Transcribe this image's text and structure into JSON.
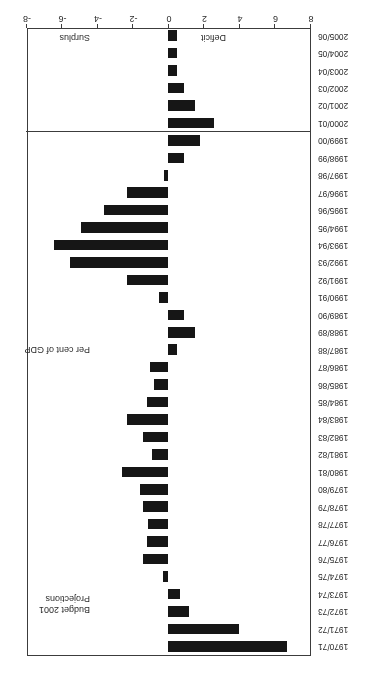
{
  "chart_data": {
    "type": "bar",
    "orientation": "horizontal",
    "title": "",
    "xlabel": "Per cent of GDP",
    "ylabel": "",
    "xlim": [
      -8,
      8
    ],
    "grid": false,
    "legend": null,
    "note": "Negative values are deficits (plotted to the right); positive values are surpluses (plotted to the left).",
    "categories": [
      "1970/71",
      "1971/72",
      "1972/73",
      "1973/74",
      "1974/75",
      "1975/76",
      "1976/77",
      "1977/78",
      "1978/79",
      "1979/80",
      "1980/81",
      "1981/82",
      "1982/83",
      "1983/84",
      "1984/85",
      "1985/86",
      "1986/87",
      "1987/88",
      "1988/89",
      "1989/90",
      "1990/91",
      "1991/92",
      "1992/93",
      "1993/94",
      "1994/95",
      "1995/96",
      "1996/97",
      "1997/98",
      "1998/99",
      "1999/00",
      "2000/01",
      "2001/02",
      "2002/03",
      "2003/04",
      "2004/05",
      "2005/06"
    ],
    "values": [
      6.7,
      4.0,
      1.2,
      0.7,
      -0.3,
      -1.4,
      -1.2,
      -1.1,
      -1.4,
      -1.6,
      -2.6,
      -0.9,
      -1.4,
      -2.3,
      -1.2,
      -0.8,
      -1.0,
      0.5,
      1.5,
      0.9,
      -0.5,
      -2.3,
      -5.5,
      -6.4,
      -4.9,
      -3.6,
      -2.3,
      -0.2,
      0.9,
      1.8,
      2.6,
      1.5,
      0.9,
      0.5,
      0.5,
      0.5
    ],
    "value_labels": null,
    "xticks": [
      8,
      6,
      4,
      2,
      0,
      -2,
      -4,
      -6,
      -8
    ],
    "xticklabels": [
      "8",
      "6",
      "4",
      "2",
      "0",
      "-2",
      "-4",
      "-6",
      "-8"
    ],
    "projection_start_category": "2000/01",
    "bar_color": "#161616",
    "frame_color": "#3c3c3c"
  },
  "annotations": {
    "surplus": "Surplus",
    "deficit": "Deficit",
    "percent_of_gdp": "Per cent of GDP",
    "projections_line1": "Budget 2001",
    "projections_line2": "Projections",
    "footnote": "Excluding Windfall tax and associated spending"
  }
}
